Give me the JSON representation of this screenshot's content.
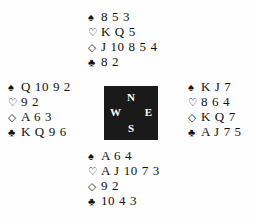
{
  "diagram": {
    "type": "bridge-hand-diagram",
    "background_color": "#fefefe",
    "text_color": "#111111"
  },
  "suits": {
    "spade": {
      "name": "spade-suit-symbol",
      "glyph": "♠",
      "style": "filled"
    },
    "heart": {
      "name": "heart-suit-symbol",
      "glyph": "♡",
      "style": "outline"
    },
    "diamond": {
      "name": "diamond-suit-symbol",
      "glyph": "◇",
      "style": "outline"
    },
    "club": {
      "name": "club-suit-symbol",
      "glyph": "♣",
      "style": "filled"
    }
  },
  "compass": {
    "background_color": "#1a1a1a",
    "text_color": "#ffffff",
    "north": "N",
    "west": "W",
    "east": "E",
    "south": "S"
  },
  "hands": {
    "north": {
      "position": "North",
      "spades": "8 5 3",
      "hearts": "K Q 5",
      "diamonds": "J 10 8 5 4",
      "clubs": "8 2"
    },
    "west": {
      "position": "West",
      "spades": "Q 10 9 2",
      "hearts": "9 2",
      "diamonds": "A 6 3",
      "clubs": "K Q 9 6"
    },
    "east": {
      "position": "East",
      "spades": "K J 7",
      "hearts": "8 6 4",
      "diamonds": "K Q 7",
      "clubs": "A J 7 5"
    },
    "south": {
      "position": "South",
      "spades": "A 6 4",
      "hearts": "A J 10 7 3",
      "diamonds": "9 2",
      "clubs": "10 4 3"
    }
  }
}
